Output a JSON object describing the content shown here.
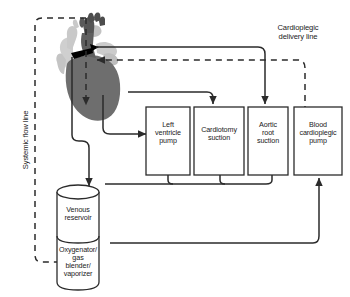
{
  "diagram": {
    "background_color": "#ffffff",
    "line_color": "#2b2b2b",
    "heart": {
      "name": "heart-illustration",
      "vessel_light_color": "#c9c9c9",
      "vessel_mid_color": "#a8a8a8",
      "muscle_color": "#6e6e6e",
      "cannula_color": "#000000"
    },
    "boxes": [
      {
        "id": "left-ventricle-pump",
        "label": "Left\nventricle\npump",
        "lines": [
          "Left",
          "ventricle",
          "pump"
        ]
      },
      {
        "id": "cardiotomy-suction",
        "label": "Cardiotomy\nsuction",
        "lines": [
          "Cardiotomy",
          "suction"
        ]
      },
      {
        "id": "aortic-root-suction",
        "label": "Aortic\nroot\nsuction",
        "lines": [
          "Aortic",
          "root",
          "suction"
        ]
      },
      {
        "id": "blood-cardioplegic-pump",
        "label": "Blood\ncardioplegic\npump",
        "lines": [
          "Blood",
          "cardioplegic",
          "pump"
        ]
      }
    ],
    "cylinder": {
      "upper": {
        "id": "venous-reservoir",
        "lines": [
          "Venous",
          "reservoir"
        ]
      },
      "lower": {
        "id": "oxygenator-gas-blender-vaporizer",
        "lines": [
          "Oxygenator/",
          "gas",
          "blender/",
          "vaporizer"
        ]
      }
    },
    "edge_labels": {
      "systemic_flow_line": "Systemic flow line",
      "cardioplegic_delivery_line_line1": "Cardioplegic",
      "cardioplegic_delivery_line_line2": "delivery line"
    }
  }
}
